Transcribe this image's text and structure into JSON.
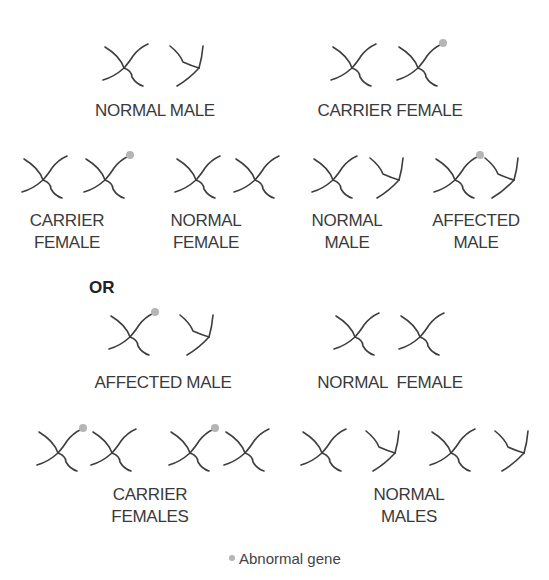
{
  "colors": {
    "chromosome": "#3d3d3d",
    "abnormal_gene": "#b5b5b5"
  },
  "groups": [
    {
      "id": "top-left",
      "label_lines": [
        "NORMAL MALE"
      ],
      "chromosomes": [
        "X",
        "Y"
      ]
    },
    {
      "id": "top-right",
      "label_lines": [
        "CARRIER FEMALE"
      ],
      "chromosomes": [
        "X",
        "X*"
      ]
    },
    {
      "id": "row2-1",
      "label_lines": [
        "CARRIER",
        "FEMALE"
      ],
      "chromosomes": [
        "X",
        "X*"
      ]
    },
    {
      "id": "row2-2",
      "label_lines": [
        "NORMAL",
        "FEMALE"
      ],
      "chromosomes": [
        "X",
        "X"
      ]
    },
    {
      "id": "row2-3",
      "label_lines": [
        "NORMAL",
        "MALE"
      ],
      "chromosomes": [
        "X",
        "Y"
      ]
    },
    {
      "id": "row2-4",
      "label_lines": [
        "AFFECTED",
        "MALE"
      ],
      "chromosomes": [
        "X*",
        "Y"
      ]
    },
    {
      "id": "row3-left",
      "label_lines": [
        "AFFECTED MALE"
      ],
      "chromosomes": [
        "X*",
        "Y"
      ]
    },
    {
      "id": "row3-right",
      "label_lines": [
        "NORMAL  FEMALE"
      ],
      "chromosomes": [
        "X",
        "X"
      ]
    },
    {
      "id": "row4-left",
      "label_lines": [
        "CARRIER",
        "FEMALES"
      ],
      "chromosomes": [
        "X*",
        "X",
        "X*",
        "X"
      ]
    },
    {
      "id": "row4-right",
      "label_lines": [
        "NORMAL",
        "MALES"
      ],
      "chromosomes": [
        "X",
        "Y",
        "X",
        "Y"
      ]
    }
  ],
  "or_label": "OR",
  "legend": {
    "marker": "abnormal-gene-dot",
    "label": "Abnormal gene"
  }
}
